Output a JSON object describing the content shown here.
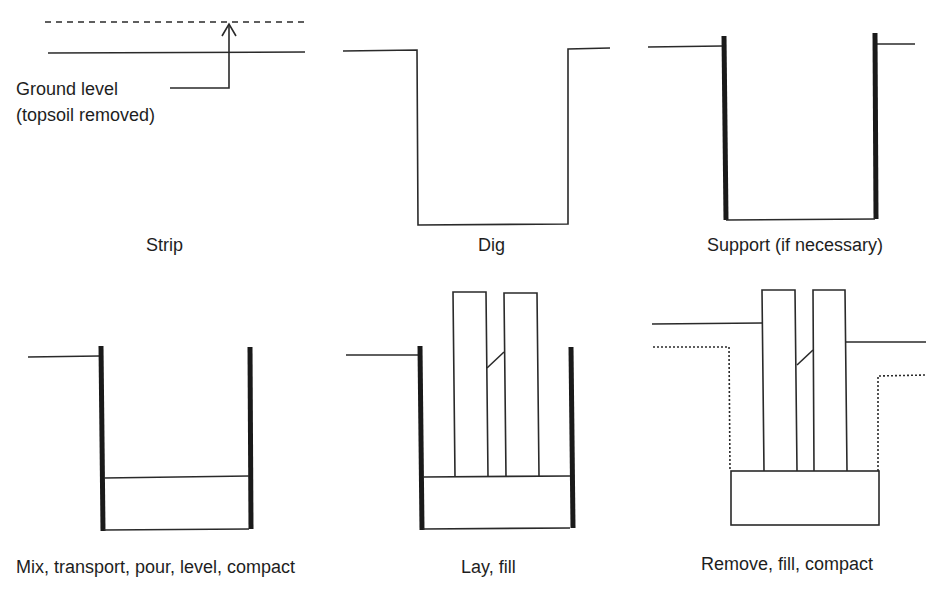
{
  "diagram": {
    "type": "process-sequence",
    "colors": {
      "line": "#2a2a2a",
      "support": "#1a1a1a",
      "text": "#1e1e1e",
      "background": "#ffffff"
    },
    "annotation": {
      "line1": "Ground level",
      "line2": "(topsoil removed)"
    },
    "steps": [
      {
        "id": "strip",
        "label": "Strip"
      },
      {
        "id": "dig",
        "label": "Dig"
      },
      {
        "id": "support",
        "label": "Support (if necessary)"
      },
      {
        "id": "concrete",
        "label": "Mix, transport, pour, level, compact"
      },
      {
        "id": "lay",
        "label": "Lay, fill"
      },
      {
        "id": "backfill",
        "label": "Remove, fill, compact"
      }
    ]
  }
}
